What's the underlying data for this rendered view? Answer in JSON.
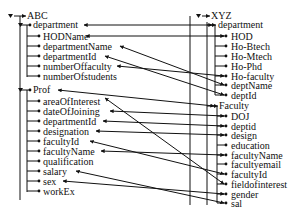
{
  "diagram": {
    "type": "schema-mapping",
    "source": {
      "root": "ABC",
      "groups": [
        {
          "name": "department",
          "fields": [
            "HODName",
            "departmentName",
            "departmentId",
            "numberOffaculty",
            "numberOfstudents"
          ]
        },
        {
          "name": "Prof",
          "fields": [
            "areaOfInterest",
            "dateOfJoining",
            "departmentId",
            "designation",
            "facultyId",
            "facultyName",
            "qualification",
            "salary",
            "sex",
            "workEx"
          ]
        }
      ]
    },
    "target": {
      "root": "XYZ",
      "groups": [
        {
          "name": "department",
          "fields": [
            "HOD",
            "Ho-Btech",
            "Ho-Mtech",
            "Ho-Phd",
            "Ho-faculty",
            "deptName",
            "deptId"
          ]
        },
        {
          "name": "Faculty",
          "fields": [
            "DOJ",
            "deptid",
            "design",
            "education",
            "facultyName",
            "facultyemail",
            "facultyId",
            "fieldofinterest",
            "gender",
            "sal"
          ]
        }
      ]
    },
    "mappings": [
      {
        "from": "ABC.department",
        "to": "XYZ.department"
      },
      {
        "from": "ABC.department.HODName",
        "to": "XYZ.department.HOD"
      },
      {
        "from": "ABC.department.departmentName",
        "to": "XYZ.department.deptName"
      },
      {
        "from": "ABC.department.departmentId",
        "to": "XYZ.department.deptId"
      },
      {
        "from": "ABC.department.numberOffaculty",
        "to": "XYZ.department.Ho-faculty"
      },
      {
        "from": "ABC.Prof",
        "to": "XYZ.Faculty"
      },
      {
        "from": "ABC.Prof.areaOfInterest",
        "to": "XYZ.Faculty.fieldofinterest"
      },
      {
        "from": "ABC.Prof.dateOfJoining",
        "to": "XYZ.Faculty.DOJ"
      },
      {
        "from": "ABC.Prof.departmentId",
        "to": "XYZ.Faculty.deptid"
      },
      {
        "from": "ABC.Prof.designation",
        "to": "XYZ.Faculty.design"
      },
      {
        "from": "ABC.Prof.facultyId",
        "to": "XYZ.Faculty.facultyId"
      },
      {
        "from": "ABC.Prof.facultyName",
        "to": "XYZ.Faculty.facultyName"
      },
      {
        "from": "ABC.Prof.salary",
        "to": "XYZ.Faculty.sal"
      },
      {
        "from": "ABC.Prof.sex",
        "to": "XYZ.Faculty.gender"
      }
    ]
  },
  "labels": {
    "left_root": "ABC",
    "left_dept": "department",
    "left_dept_fields": [
      "HODName",
      "departmentName",
      "departmentId",
      "numberOffaculty",
      "numberOfstudents"
    ],
    "left_prof": "Prof",
    "left_prof_fields": [
      "areaOfInterest",
      "dateOfJoining",
      "departmentId",
      "designation",
      "facultyId",
      "facultyName",
      "qualification",
      "salary",
      "sex",
      "workEx"
    ],
    "right_root": "XYZ",
    "right_dept": "department",
    "right_dept_fields": [
      "HOD",
      "Ho-Btech",
      "Ho-Mtech",
      "Ho-Phd",
      "Ho-faculty",
      "deptName",
      "deptId"
    ],
    "right_fac": "Faculty",
    "right_fac_fields": [
      "DOJ",
      "deptid",
      "design",
      "education",
      "facultyName",
      "facultyemail",
      "facultyId",
      "fieldofinterest",
      "gender",
      "sal"
    ]
  },
  "icons": {
    "collapse_toggle": "triangle-down-icon",
    "connector": "arrow-icon"
  }
}
